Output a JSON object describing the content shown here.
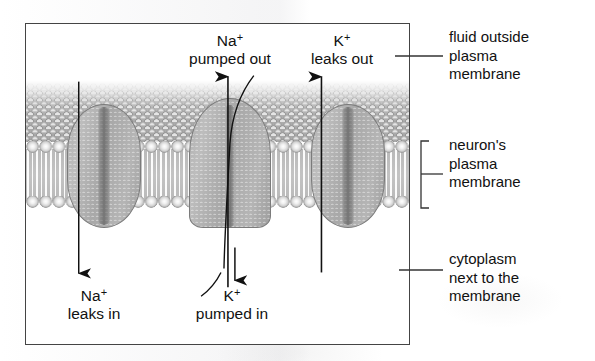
{
  "figure": {
    "in_figure_labels": [
      {
        "id": "na-pumped-out",
        "line1": "Na",
        "sup": "+",
        "line2": "pumped out"
      },
      {
        "id": "k-leaks-out",
        "line1": "K",
        "sup": "+",
        "line2": "leaks out"
      },
      {
        "id": "na-leaks-in",
        "line1": "Na",
        "sup": "+",
        "line2": "leaks in"
      },
      {
        "id": "k-pumped-in",
        "line1": "K",
        "sup": "+",
        "line2": "pumped in"
      }
    ],
    "callouts": [
      {
        "id": "fluid-outside",
        "text": "fluid outside\nplasma\nmembrane"
      },
      {
        "id": "neurons-membrane",
        "text": "neuron's\nplasma\nmembrane"
      },
      {
        "id": "cytoplasm",
        "text": "cytoplasm\nnext to the\nmembrane"
      }
    ],
    "structures": [
      {
        "id": "na-leak-channel",
        "kind": "channel",
        "label": "sodium leak channel"
      },
      {
        "id": "na-k-pump",
        "kind": "pump",
        "label": "sodium-potassium pump"
      },
      {
        "id": "k-leak-channel",
        "kind": "channel",
        "label": "potassium leak channel"
      }
    ],
    "colors": {
      "protein_fill": "#b0b0b0",
      "protein_outline": "#7b7b7b",
      "extracellular_fluid": "#a5a5a5",
      "bilayer_tails": "#bdbdbd",
      "frame": "#444444",
      "text": "#111111",
      "arrow": "#111111",
      "background": "#ffffff"
    }
  }
}
